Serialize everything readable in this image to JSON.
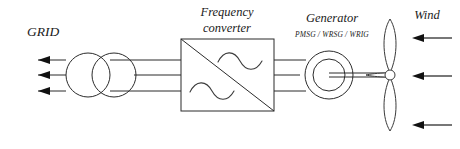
{
  "diagram": {
    "background_color": "#ffffff",
    "line_color": "#2b2b2b",
    "labels": {
      "grid": "GRID",
      "converter_line1": "Frequency",
      "converter_line2": "converter",
      "generator": "Generator",
      "generator_types": "PMSG / WRSG / WRIG",
      "wind": "Wind"
    },
    "components": [
      {
        "name": "grid-arrows",
        "label": "GRID",
        "count": 3,
        "direction": "left"
      },
      {
        "name": "transformer",
        "label": "",
        "symbol": "two-overlapping-circles"
      },
      {
        "name": "frequency-converter",
        "label": "Frequency converter",
        "symbol": "square-with-diagonal-and-sine-waves"
      },
      {
        "name": "generator",
        "label": "Generator",
        "symbol": "double-circle"
      },
      {
        "name": "wind-turbine",
        "label": "",
        "symbol": "three-blade-rotor",
        "blades": 3
      },
      {
        "name": "wind-arrows",
        "label": "Wind",
        "count": 3,
        "direction": "left"
      }
    ],
    "connections": {
      "phases": 3,
      "grid_to_transformer": 3,
      "transformer_to_converter": 3,
      "converter_to_generator": 3,
      "generator_to_rotor": "shaft"
    }
  }
}
